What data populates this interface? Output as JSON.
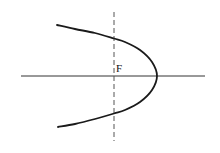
{
  "diagram": {
    "type": "conic-section",
    "curve": "parabola opening left",
    "focus_label": "F",
    "elements": [
      "horizontal-axis",
      "directrix-dashed-vertical-line",
      "parabola-curve",
      "focus-label"
    ],
    "colors": {
      "background": "#ffffff",
      "stroke": "#1a1a1a",
      "axis": "#333333",
      "dashed": "#555555"
    }
  }
}
